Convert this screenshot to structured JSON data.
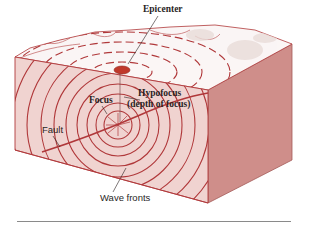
{
  "diagram": {
    "labels": {
      "epicenter": "Epicenter",
      "focus": "Focus",
      "hypofocus_line1": "Hypofocus",
      "hypofocus_line2": "(depth of focus)",
      "fault": "Fault",
      "wave_fronts": "Wave fronts"
    },
    "colors": {
      "front_face": "#f0d3d0",
      "right_face": "#cf8e8a",
      "top_surface": "#fbf6f5",
      "wave_line": "#b0383a",
      "epicenter_fill": "#c0392b",
      "label_text": "#2a1f1f",
      "rule": "#8a8a8a"
    }
  }
}
